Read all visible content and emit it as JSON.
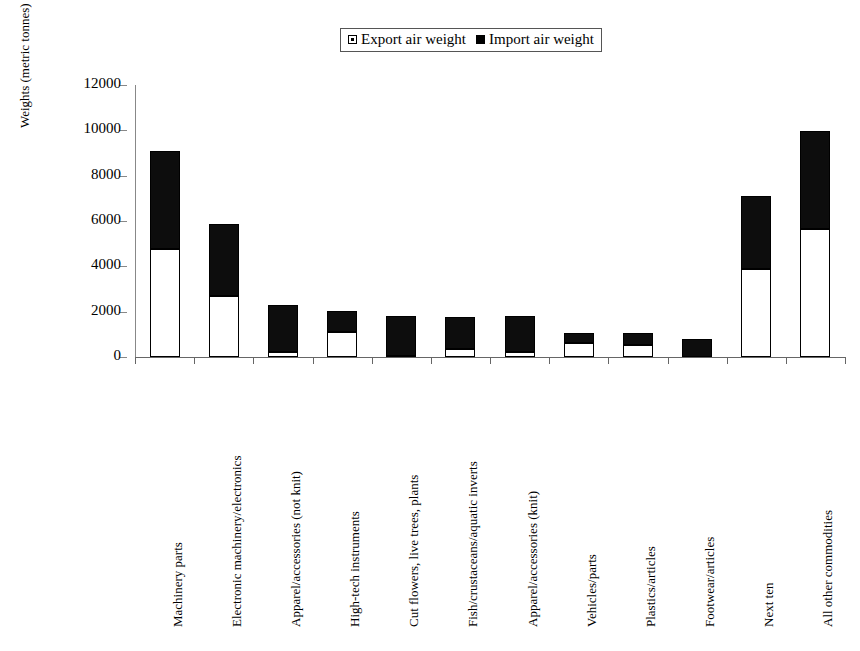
{
  "chart_data": {
    "type": "bar",
    "subtype": "stacked-vertical",
    "title": "",
    "xlabel": "",
    "ylabel": "Weights (metric tonnes)",
    "ylim": [
      0,
      12000
    ],
    "ytick_labels": [
      "0",
      "2000",
      "4000",
      "6000",
      "8000",
      "10000",
      "12000"
    ],
    "ytick_values": [
      0,
      2000,
      4000,
      6000,
      8000,
      10000,
      12000
    ],
    "grid": false,
    "legend_position": "top-center",
    "categories": [
      "Machinery parts",
      "Electronic machinery/electronics",
      "Apparel/accessories (not knit)",
      "High-tech instruments",
      "Cut flowers, live trees, plants",
      "Fish/crustaceans/aquatic inverts",
      "Apparel/accessories (knit)",
      "Vehicles/parts",
      "Plastics/articles",
      "Footwear/articles",
      "Next ten",
      "All other commodities"
    ],
    "series": [
      {
        "name": "Export air weight",
        "color": "#ffffff",
        "values": [
          4750,
          2700,
          200,
          1100,
          50,
          350,
          230,
          600,
          520,
          0,
          3900,
          5650
        ]
      },
      {
        "name": "Import air weight",
        "color": "#000000",
        "values": [
          4350,
          3150,
          2100,
          950,
          1750,
          1400,
          1570,
          450,
          530,
          800,
          3200,
          4300
        ]
      }
    ],
    "totals": [
      9100,
      5850,
      2300,
      2050,
      1800,
      1750,
      1800,
      1050,
      1050,
      800,
      7100,
      9950
    ]
  },
  "legend": {
    "entries": [
      {
        "label": "Export air weight",
        "swatch": "hollow-square-icon"
      },
      {
        "label": "Import air weight",
        "swatch": "filled-square-icon"
      }
    ]
  }
}
